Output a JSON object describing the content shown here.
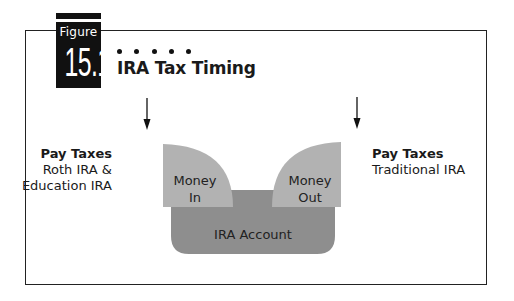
{
  "figure": {
    "label_word": "Figure",
    "number": "15.1",
    "dots": 5,
    "title": "IRA Tax Timing"
  },
  "left_annotation": {
    "heading": "Pay Taxes",
    "line1": "Roth IRA &",
    "line2": "Education IRA",
    "arrow": "down-arrow-icon"
  },
  "right_annotation": {
    "heading": "Pay Taxes",
    "line1": "Traditional IRA",
    "arrow": "down-arrow-icon"
  },
  "shapes": {
    "money_in": {
      "line1": "Money",
      "line2": "In"
    },
    "money_out": {
      "line1": "Money",
      "line2": "Out"
    },
    "account": {
      "label": "IRA Account"
    }
  },
  "colors": {
    "light_gray": "#b2b2b2",
    "dark_gray": "#8e8e8e",
    "frame": "#222222",
    "figure_box": "#111111"
  }
}
